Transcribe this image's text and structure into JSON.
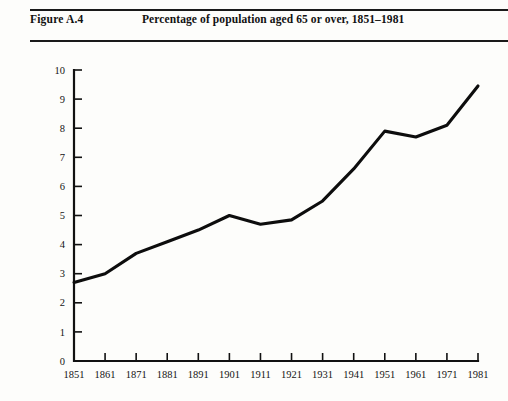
{
  "figure": {
    "label": "Figure A.4",
    "title": "Percentage of population aged 65 or over, 1851–1981"
  },
  "chart_data": {
    "type": "line",
    "title": "Percentage of population aged 65 or over, 1851–1981",
    "xlabel": "",
    "ylabel": "",
    "categories": [
      "1851",
      "1861",
      "1871",
      "1881",
      "1891",
      "1901",
      "1911",
      "1921",
      "1931",
      "1941",
      "1951",
      "1961",
      "1971",
      "1981"
    ],
    "x": [
      1851,
      1861,
      1871,
      1881,
      1891,
      1901,
      1911,
      1921,
      1931,
      1941,
      1951,
      1961,
      1971,
      1981
    ],
    "values": [
      2.7,
      3.0,
      3.7,
      4.1,
      4.5,
      5.0,
      4.7,
      4.85,
      5.5,
      6.6,
      7.9,
      7.7,
      8.1,
      9.45
    ],
    "series": [
      {
        "name": "Percentage aged 65 or over",
        "values": [
          2.7,
          3.0,
          3.7,
          4.1,
          4.5,
          5.0,
          4.7,
          4.85,
          5.5,
          6.6,
          7.9,
          7.7,
          8.1,
          9.45
        ],
        "color": "#0d0d0d"
      }
    ],
    "ylim": [
      0,
      10
    ],
    "yticks": [
      0,
      1,
      2,
      3,
      4,
      5,
      6,
      7,
      8,
      9,
      10
    ],
    "ytick_labels": [
      "0",
      "1",
      "2",
      "3",
      "4",
      "5",
      "6",
      "7",
      "8",
      "9",
      "10"
    ],
    "xtick_labels": [
      "1851",
      "1861",
      "1871",
      "1881",
      "1891",
      "1901",
      "1911",
      "1921",
      "1931",
      "1941",
      "1951",
      "1961",
      "1971",
      "1981"
    ],
    "grid": false,
    "legend": false,
    "legend_position": "none",
    "line_color": "#0d0d0d",
    "axis_color": "#111111",
    "background": "#fdfdfb"
  }
}
